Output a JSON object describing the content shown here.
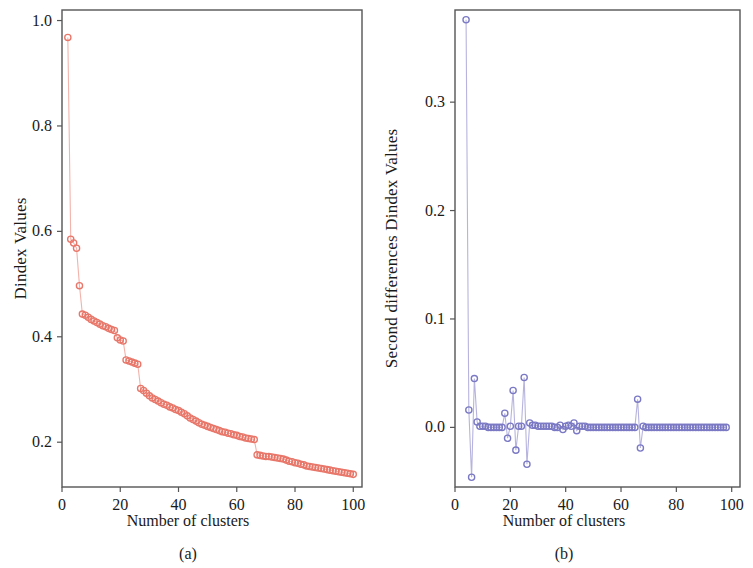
{
  "figure": {
    "background": "#ffffff",
    "frame_color": "#555555"
  },
  "panels": [
    {
      "caption": "(a)",
      "ylabel": "Dindex Values",
      "xlabel": "Number of clusters",
      "yticks": [
        "0.2",
        "0.4",
        "0.6",
        "0.8",
        "1.0"
      ],
      "xticks": [
        "0",
        "20",
        "40",
        "60",
        "80",
        "100"
      ],
      "marker_color": "#e8776a",
      "line_color": "#f2b3ab"
    },
    {
      "caption": "(b)",
      "ylabel": "Second differences Dindex Values",
      "xlabel": "Number of clusters",
      "yticks": [
        "0.0",
        "0.1",
        "0.2",
        "0.3"
      ],
      "xticks": [
        "0",
        "20",
        "40",
        "60",
        "80",
        "100"
      ],
      "marker_color": "#7b79c4",
      "line_color": "#b6b4de"
    }
  ],
  "chart_data": [
    {
      "type": "scatter",
      "panel": "(a)",
      "title": "",
      "xlabel": "Number of clusters",
      "ylabel": "Dindex Values",
      "xlim": [
        0,
        103
      ],
      "ylim": [
        0.115,
        1.02
      ],
      "xticks": [
        0,
        20,
        40,
        60,
        80,
        100
      ],
      "yticks": [
        0.2,
        0.4,
        0.6,
        0.8,
        1.0
      ],
      "grid": false,
      "legend": "none",
      "marker": "open-circle",
      "connected": true,
      "x": [
        2,
        3,
        4,
        5,
        6,
        7,
        8,
        9,
        10,
        11,
        12,
        13,
        14,
        15,
        16,
        17,
        18,
        19,
        20,
        21,
        22,
        23,
        24,
        25,
        26,
        27,
        28,
        29,
        30,
        31,
        32,
        33,
        34,
        35,
        36,
        37,
        38,
        39,
        40,
        41,
        42,
        43,
        44,
        45,
        46,
        47,
        48,
        49,
        50,
        51,
        52,
        53,
        54,
        55,
        56,
        57,
        58,
        59,
        60,
        61,
        62,
        63,
        64,
        65,
        66,
        67,
        68,
        69,
        70,
        71,
        72,
        73,
        74,
        75,
        76,
        77,
        78,
        79,
        80,
        81,
        82,
        83,
        84,
        85,
        86,
        87,
        88,
        89,
        90,
        91,
        92,
        93,
        94,
        95,
        96,
        97,
        98,
        99,
        100
      ],
      "y": [
        0.968,
        0.585,
        0.578,
        0.568,
        0.497,
        0.443,
        0.441,
        0.437,
        0.433,
        0.43,
        0.427,
        0.424,
        0.421,
        0.419,
        0.416,
        0.414,
        0.412,
        0.398,
        0.394,
        0.392,
        0.356,
        0.354,
        0.352,
        0.35,
        0.348,
        0.302,
        0.298,
        0.293,
        0.288,
        0.284,
        0.281,
        0.278,
        0.275,
        0.272,
        0.27,
        0.267,
        0.265,
        0.262,
        0.26,
        0.257,
        0.254,
        0.25,
        0.246,
        0.243,
        0.24,
        0.237,
        0.234,
        0.232,
        0.23,
        0.228,
        0.226,
        0.224,
        0.222,
        0.22,
        0.219,
        0.217,
        0.216,
        0.214,
        0.213,
        0.211,
        0.21,
        0.208,
        0.207,
        0.206,
        0.205,
        0.176,
        0.175,
        0.174,
        0.173,
        0.173,
        0.172,
        0.171,
        0.17,
        0.169,
        0.168,
        0.166,
        0.164,
        0.163,
        0.161,
        0.16,
        0.158,
        0.157,
        0.155,
        0.154,
        0.153,
        0.152,
        0.151,
        0.15,
        0.149,
        0.148,
        0.147,
        0.146,
        0.145,
        0.144,
        0.143,
        0.142,
        0.141,
        0.14,
        0.139
      ]
    },
    {
      "type": "scatter",
      "panel": "(b)",
      "title": "",
      "xlabel": "Number of clusters",
      "ylabel": "Second differences Dindex Values",
      "xlim": [
        0,
        103
      ],
      "ylim": [
        -0.055,
        0.385
      ],
      "xticks": [
        0,
        20,
        40,
        60,
        80,
        100
      ],
      "yticks": [
        0.0,
        0.1,
        0.2,
        0.3
      ],
      "grid": false,
      "legend": "none",
      "marker": "open-circle",
      "connected": true,
      "x": [
        4,
        5,
        6,
        7,
        8,
        9,
        10,
        11,
        12,
        13,
        14,
        15,
        16,
        17,
        18,
        19,
        20,
        21,
        22,
        23,
        24,
        25,
        26,
        27,
        28,
        29,
        30,
        31,
        32,
        33,
        34,
        35,
        36,
        37,
        38,
        39,
        40,
        41,
        42,
        43,
        44,
        45,
        46,
        47,
        48,
        49,
        50,
        51,
        52,
        53,
        54,
        55,
        56,
        57,
        58,
        59,
        60,
        61,
        62,
        63,
        64,
        65,
        66,
        67,
        68,
        69,
        70,
        71,
        72,
        73,
        74,
        75,
        76,
        77,
        78,
        79,
        80,
        81,
        82,
        83,
        84,
        85,
        86,
        87,
        88,
        89,
        90,
        91,
        92,
        93,
        94,
        95,
        96,
        97,
        98
      ],
      "y": [
        0.376,
        0.016,
        -0.046,
        0.045,
        0.005,
        0.001,
        0.001,
        0.001,
        0.0,
        0.0,
        0.0,
        0.0,
        0.0,
        0.0,
        0.013,
        -0.01,
        0.001,
        0.034,
        -0.021,
        0.001,
        0.001,
        0.046,
        -0.034,
        0.004,
        0.002,
        0.002,
        0.001,
        0.001,
        0.001,
        0.001,
        0.001,
        0.001,
        0.0,
        0.0,
        0.002,
        -0.002,
        0.001,
        0.002,
        0.001,
        0.004,
        -0.003,
        0.001,
        0.001,
        0.001,
        0.0,
        0.0,
        0.0,
        0.0,
        0.0,
        0.0,
        0.0,
        0.0,
        0.0,
        0.0,
        0.0,
        0.0,
        0.0,
        0.0,
        0.0,
        0.0,
        0.0,
        0.0,
        0.026,
        -0.019,
        0.001,
        0.0,
        0.0,
        0.0,
        0.0,
        0.0,
        0.0,
        0.0,
        0.0,
        0.0,
        0.0,
        0.0,
        0.0,
        0.0,
        0.0,
        0.0,
        0.0,
        0.0,
        0.0,
        0.0,
        0.0,
        0.0,
        0.0,
        0.0,
        0.0,
        0.0,
        0.0,
        0.0,
        0.0,
        0.0,
        0.0,
        0.0,
        0.0,
        0.0
      ]
    }
  ]
}
